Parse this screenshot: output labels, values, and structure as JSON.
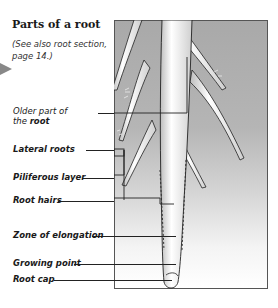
{
  "title": "Parts of a root",
  "note": "(See also root section, page 14.)",
  "labels": {
    "older_part_prefix": "Older part of",
    "older_part_the": "the",
    "older_part_bold": "root",
    "lateral_roots": "Lateral roots",
    "piliferous_layer": "Piliferous layer",
    "root_hairs": "Root hairs",
    "zone_of_elongation": "Zone of elongation",
    "growing_point": "Growing point",
    "root_cap": "Root cap"
  },
  "colors": {
    "panel_top": "#a9a9a9",
    "panel_bottom": "#ffffff",
    "root_fill": "#eeeeee",
    "outline": "#222222"
  }
}
